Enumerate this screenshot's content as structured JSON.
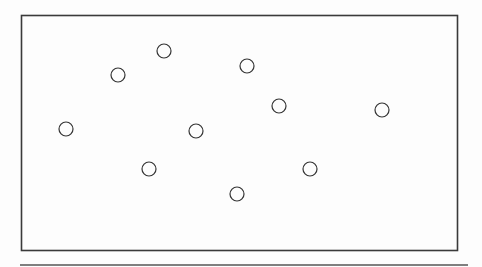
{
  "diagram": {
    "canvas": {
      "width": 482,
      "height": 267,
      "background": "#fdfdfd"
    },
    "frame": {
      "x": 21.5,
      "y": 15.5,
      "width": 436,
      "height": 235,
      "stroke": "#3a3a3a",
      "stroke_width": 1.6
    },
    "baseline": {
      "x1": 20,
      "y1": 265,
      "x2": 468,
      "y2": 265,
      "stroke": "#555555",
      "stroke_width": 1.6
    },
    "circle_style": {
      "radius": 7,
      "stroke": "#333333",
      "stroke_width": 1.2,
      "fill": "none"
    },
    "circles": [
      {
        "id": "c1",
        "cx": 164,
        "cy": 51
      },
      {
        "id": "c2",
        "cx": 247,
        "cy": 66
      },
      {
        "id": "c3",
        "cx": 118,
        "cy": 75
      },
      {
        "id": "c4",
        "cx": 279,
        "cy": 106
      },
      {
        "id": "c5",
        "cx": 382,
        "cy": 110
      },
      {
        "id": "c6",
        "cx": 66,
        "cy": 129
      },
      {
        "id": "c7",
        "cx": 196,
        "cy": 131
      },
      {
        "id": "c8",
        "cx": 149,
        "cy": 169
      },
      {
        "id": "c9",
        "cx": 310,
        "cy": 169
      },
      {
        "id": "c10",
        "cx": 237,
        "cy": 194
      }
    ],
    "circle_count": 10
  }
}
